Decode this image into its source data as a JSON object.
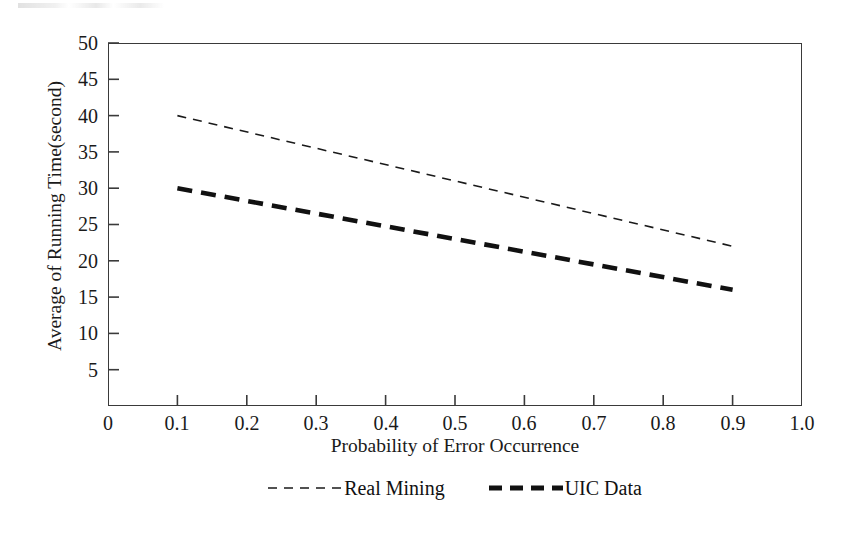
{
  "chart_data": {
    "type": "line",
    "title": "",
    "xlabel": "Probability of Error Occurrence",
    "ylabel": "Average of Running Time(second)",
    "xlim": [
      0,
      1.0
    ],
    "ylim": [
      0,
      50
    ],
    "xticks": [
      "0",
      "0.1",
      "0.2",
      "0.3",
      "0.4",
      "0.5",
      "0.6",
      "0.7",
      "0.8",
      "0.9",
      "1.0"
    ],
    "xtick_values": [
      0,
      0.1,
      0.2,
      0.3,
      0.4,
      0.5,
      0.6,
      0.7,
      0.8,
      0.9,
      1.0
    ],
    "yticks": [
      "5",
      "10",
      "15",
      "20",
      "25",
      "30",
      "35",
      "40",
      "45",
      "50"
    ],
    "ytick_values": [
      5,
      10,
      15,
      20,
      25,
      30,
      35,
      40,
      45,
      50
    ],
    "grid": false,
    "legend_position": "below-axes",
    "frame": "box",
    "x": [
      0.1,
      0.9
    ],
    "series": [
      {
        "name": "Real Mining",
        "values": [
          40,
          22
        ],
        "style": "dashed-thin",
        "color": "#1a1a1a",
        "linewidth": 1.6,
        "dash": "9,7"
      },
      {
        "name": "UIC Data",
        "values": [
          30,
          16
        ],
        "style": "dashed-thick",
        "color": "#111111",
        "linewidth": 4.6,
        "dash": "15,9"
      }
    ]
  },
  "axes": {
    "y_title": "Average of Running Time(second)",
    "x_title": "Probability of Error Occurrence",
    "y_labels": [
      "50",
      "45",
      "40",
      "35",
      "30",
      "25",
      "20",
      "15",
      "10",
      "5"
    ],
    "x_labels": [
      "0",
      "0.1",
      "0.2",
      "0.3",
      "0.4",
      "0.5",
      "0.6",
      "0.7",
      "0.8",
      "0.9",
      "1.0"
    ]
  },
  "legend": {
    "entries": [
      {
        "label": "Real Mining",
        "marker": "thin-dashed-line-icon"
      },
      {
        "label": "UIC Data",
        "marker": "thick-dashed-line-icon"
      }
    ]
  }
}
